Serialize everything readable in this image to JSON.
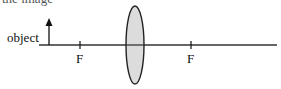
{
  "caption": "the image",
  "diagram": {
    "type": "optics ray diagram - converging lens",
    "object_label": "object",
    "focal_labels": [
      "F",
      "F"
    ],
    "colors": {
      "line": "#333333",
      "lens_fill": "#dcdcdc",
      "lens_stroke": "#222222"
    }
  }
}
